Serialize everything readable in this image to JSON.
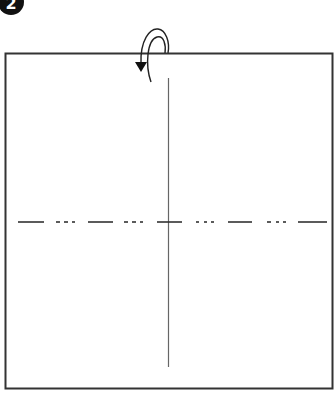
{
  "diagram": {
    "type": "origami-step",
    "step_badge": {
      "label": "2",
      "fill": "#111111",
      "text_color": "#ffffff"
    },
    "paper": {
      "shape": "square",
      "border_color": "#333333",
      "fill": "#ffffff"
    },
    "creases": [
      {
        "name": "vertical-crease",
        "style": "solid",
        "orientation": "vertical",
        "color": "#555555"
      },
      {
        "name": "horizontal-mountain-fold-line",
        "style": "dash-dot-dot",
        "orientation": "horizontal",
        "color": "#333333"
      }
    ],
    "arrow": {
      "name": "fold-behind-arrow",
      "meaning": "fold behind / turn over",
      "color": "#222222"
    }
  }
}
